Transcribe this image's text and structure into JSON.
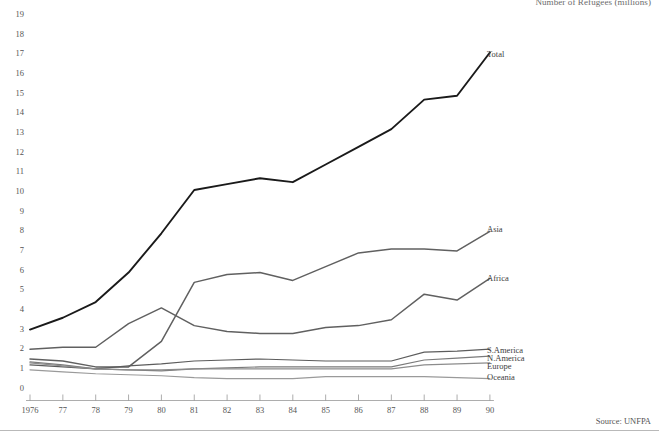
{
  "figure": {
    "top_caption": "Number of Refugees (millions)",
    "source": "Source: UNFPA"
  },
  "chart_data": {
    "type": "line",
    "title": "Number of Refugees (millions)",
    "xlabel": "",
    "ylabel": "Number of Refugees (millions)",
    "x": [
      1976,
      1977,
      1978,
      1979,
      1980,
      1981,
      1982,
      1983,
      1984,
      1985,
      1986,
      1987,
      1988,
      1989,
      1990
    ],
    "categories": [
      "1976",
      "77",
      "78",
      "79",
      "80",
      "81",
      "82",
      "83",
      "84",
      "85",
      "86",
      "87",
      "88",
      "89",
      "90"
    ],
    "ylim": [
      0,
      20
    ],
    "yticks": [
      0,
      1,
      2,
      3,
      4,
      5,
      6,
      7,
      8,
      9,
      10,
      11,
      12,
      13,
      14,
      15,
      16,
      17,
      18,
      19,
      20
    ],
    "grid": false,
    "legend_position": "right-inline",
    "series": [
      {
        "name": "Total",
        "color": "#1a1a1a",
        "width": 1.9,
        "label_y": 17.0,
        "values": [
          3.0,
          3.6,
          4.4,
          5.9,
          7.9,
          10.1,
          10.4,
          10.7,
          10.5,
          11.4,
          12.3,
          13.2,
          14.7,
          14.9,
          17.1
        ]
      },
      {
        "name": "Asia",
        "color": "#606060",
        "width": 1.5,
        "label_y": 8.1,
        "values": [
          1.5,
          1.4,
          1.1,
          1.1,
          2.4,
          5.4,
          5.8,
          5.9,
          5.5,
          6.2,
          6.9,
          7.1,
          7.1,
          7.0,
          8.0
        ]
      },
      {
        "name": "Africa",
        "color": "#606060",
        "width": 1.5,
        "label_y": 5.6,
        "values": [
          2.0,
          2.1,
          2.1,
          3.3,
          4.1,
          3.2,
          2.9,
          2.8,
          2.8,
          3.1,
          3.2,
          3.5,
          4.8,
          4.5,
          5.6
        ]
      },
      {
        "name": "S.America",
        "color": "#5c5c5c",
        "width": 1.2,
        "label_y": 1.95,
        "values": [
          1.2,
          1.1,
          1.0,
          1.15,
          1.25,
          1.4,
          1.45,
          1.5,
          1.45,
          1.4,
          1.4,
          1.4,
          1.85,
          1.9,
          2.0
        ]
      },
      {
        "name": "N.America",
        "color": "#7a7a7a",
        "width": 1.2,
        "label_y": 1.55,
        "values": [
          1.35,
          1.2,
          1.0,
          0.95,
          0.9,
          1.0,
          1.05,
          1.1,
          1.1,
          1.1,
          1.1,
          1.1,
          1.45,
          1.55,
          1.65
        ]
      },
      {
        "name": "Europe",
        "color": "#8c8c8c",
        "width": 1.2,
        "label_y": 1.15,
        "values": [
          1.3,
          1.15,
          1.0,
          0.95,
          0.95,
          1.0,
          1.0,
          1.0,
          1.0,
          1.0,
          1.0,
          1.0,
          1.2,
          1.25,
          1.3
        ]
      },
      {
        "name": "Oceania",
        "color": "#9a9a9a",
        "width": 1.2,
        "label_y": 0.6,
        "values": [
          0.95,
          0.85,
          0.75,
          0.7,
          0.65,
          0.55,
          0.5,
          0.5,
          0.5,
          0.6,
          0.6,
          0.6,
          0.6,
          0.55,
          0.5
        ]
      }
    ]
  }
}
